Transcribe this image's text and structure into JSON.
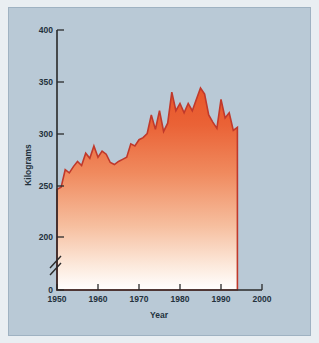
{
  "chart_data": {
    "type": "area",
    "title": "",
    "xlabel": "Year",
    "ylabel": "Kilograms",
    "xlim": [
      1950,
      2000
    ],
    "ylim": [
      0,
      400
    ],
    "y_axis_break": true,
    "y_break_between": [
      0,
      200
    ],
    "grid": false,
    "legend": null,
    "xticks": [
      1950,
      1960,
      1970,
      1980,
      1990,
      2000
    ],
    "yticks": [
      0,
      200,
      250,
      300,
      350,
      400
    ],
    "series_color": "#E8562A",
    "line_color": "#C0392B",
    "x": [
      1950,
      1951,
      1952,
      1953,
      1954,
      1955,
      1956,
      1957,
      1958,
      1959,
      1960,
      1961,
      1962,
      1963,
      1964,
      1965,
      1966,
      1967,
      1968,
      1969,
      1970,
      1971,
      1972,
      1973,
      1974,
      1975,
      1976,
      1977,
      1978,
      1979,
      1980,
      1981,
      1982,
      1983,
      1984,
      1985,
      1986,
      1987,
      1988,
      1989,
      1990,
      1991,
      1992,
      1993,
      1994
    ],
    "values": [
      246,
      248,
      265,
      262,
      268,
      273,
      269,
      281,
      276,
      288,
      277,
      283,
      280,
      272,
      270,
      273,
      275,
      277,
      290,
      288,
      294,
      296,
      300,
      318,
      304,
      322,
      302,
      310,
      340,
      322,
      329,
      320,
      329,
      322,
      333,
      344,
      338,
      318,
      311,
      305,
      333,
      315,
      320,
      303,
      306
    ],
    "annotations": []
  },
  "axis": {
    "ylabel": "Kilograms",
    "xlabel": "Year",
    "ytick_labels": [
      "400",
      "350",
      "300",
      "250",
      "200",
      "0"
    ],
    "xtick_labels": [
      "1950",
      "1960",
      "1970",
      "1980",
      "1990",
      "2000"
    ]
  },
  "colors": {
    "panel_background": "#b9c9d6",
    "page_background": "#e9eef2",
    "area_top": "#E8562A",
    "area_bottom": "#ffffff",
    "axis": "#2a2a2a",
    "label": "#23313c"
  }
}
